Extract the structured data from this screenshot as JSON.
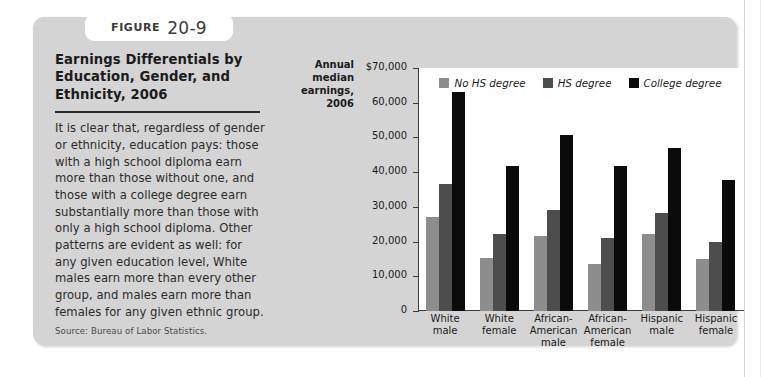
{
  "figure": {
    "tab_word": "Figure",
    "tab_number": "20-9",
    "title": "Earnings Differentials by Education, Gender, and Ethnicity, 2006",
    "body": "It is clear that, regardless of gender or ethnicity, education pays: those with a high school diploma earn more than those without one, and those with a college degree earn substantially more than those with only a high school diploma. Other patterns are evident as well: for any given education level, White males earn more than every other group, and males earn more than females for any given ethnic group.",
    "source": "Source: Bureau of Labor Statistics."
  },
  "chart_data": {
    "type": "bar",
    "title": "Earnings Differentials by Education, Gender, and Ethnicity, 2006",
    "axis_title": "Annual median earnings, 2006",
    "xlabel": "",
    "ylabel": "Annual median earnings, 2006",
    "ylim": [
      0,
      70000
    ],
    "grid": false,
    "legend_position": "top-center",
    "ytick_labels": [
      "$70,000",
      "60,000",
      "50,000",
      "40,000",
      "30,000",
      "20,000",
      "10,000",
      "0"
    ],
    "ytick_values": [
      70000,
      60000,
      50000,
      40000,
      30000,
      20000,
      10000,
      0
    ],
    "categories": [
      "White male",
      "White female",
      "African-American male",
      "African-American female",
      "Hispanic male",
      "Hispanic female"
    ],
    "category_lines": [
      [
        "White",
        "male"
      ],
      [
        "White",
        "female"
      ],
      [
        "African-",
        "American",
        "male"
      ],
      [
        "African-",
        "American",
        "female"
      ],
      [
        "Hispanic",
        "male"
      ],
      [
        "Hispanic",
        "female"
      ]
    ],
    "series": [
      {
        "name": "No HS degree",
        "color": "#8d8d8d",
        "values": [
          27000,
          15200,
          21500,
          13600,
          22100,
          15000
        ]
      },
      {
        "name": "HS degree",
        "color": "#4d4d4d",
        "values": [
          36500,
          22200,
          29000,
          21000,
          28200,
          20000
        ]
      },
      {
        "name": "College degree",
        "color": "#0a0a0a",
        "values": [
          63200,
          41700,
          50700,
          41800,
          47000,
          37600
        ]
      }
    ]
  },
  "colors": {
    "card_background": "#d4d4d4",
    "plot_background": "#ffffff",
    "axis": "#3c3c3c",
    "no_hs": "#8d8d8d",
    "hs": "#4d4d4d",
    "college": "#0a0a0a"
  }
}
